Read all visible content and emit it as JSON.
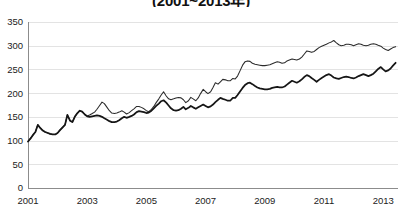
{
  "chart_data": {
    "type": "line",
    "title": "(2001~2013年)",
    "xlabel": "",
    "ylabel": "",
    "ylim": [
      0,
      350
    ],
    "xlim": [
      2001,
      2013.5
    ],
    "grid": true,
    "legend": "none",
    "ytick_labels": [
      "350",
      "300",
      "250",
      "200",
      "150",
      "100",
      "50",
      "0"
    ],
    "ytick_values": [
      350,
      300,
      250,
      200,
      150,
      100,
      50,
      0
    ],
    "xtick_labels": [
      "2001",
      "2003",
      "2005",
      "2007",
      "2009",
      "2011",
      "2013"
    ],
    "xtick_values": [
      2001,
      2003,
      2005,
      2007,
      2009,
      2011,
      2013
    ],
    "x": [
      2001.0,
      2001.08,
      2001.17,
      2001.25,
      2001.33,
      2001.42,
      2001.5,
      2001.58,
      2001.67,
      2001.75,
      2001.83,
      2001.92,
      2002.0,
      2002.08,
      2002.17,
      2002.25,
      2002.33,
      2002.42,
      2002.5,
      2002.58,
      2002.67,
      2002.75,
      2002.83,
      2002.92,
      2003.0,
      2003.08,
      2003.17,
      2003.25,
      2003.33,
      2003.42,
      2003.5,
      2003.58,
      2003.67,
      2003.75,
      2003.83,
      2003.92,
      2004.0,
      2004.08,
      2004.17,
      2004.25,
      2004.33,
      2004.42,
      2004.5,
      2004.58,
      2004.67,
      2004.75,
      2004.83,
      2004.92,
      2005.0,
      2005.08,
      2005.17,
      2005.25,
      2005.33,
      2005.42,
      2005.5,
      2005.58,
      2005.67,
      2005.75,
      2005.83,
      2005.92,
      2006.0,
      2006.08,
      2006.17,
      2006.25,
      2006.33,
      2006.42,
      2006.5,
      2006.58,
      2006.67,
      2006.75,
      2006.83,
      2006.92,
      2007.0,
      2007.08,
      2007.17,
      2007.25,
      2007.33,
      2007.42,
      2007.5,
      2007.58,
      2007.67,
      2007.75,
      2007.83,
      2007.92,
      2008.0,
      2008.08,
      2008.17,
      2008.25,
      2008.33,
      2008.42,
      2008.5,
      2008.58,
      2008.67,
      2008.75,
      2008.83,
      2008.92,
      2009.0,
      2009.08,
      2009.17,
      2009.25,
      2009.33,
      2009.42,
      2009.5,
      2009.58,
      2009.67,
      2009.75,
      2009.83,
      2009.92,
      2010.0,
      2010.08,
      2010.17,
      2010.25,
      2010.33,
      2010.42,
      2010.5,
      2010.58,
      2010.67,
      2010.75,
      2010.83,
      2010.92,
      2011.0,
      2011.08,
      2011.17,
      2011.25,
      2011.33,
      2011.42,
      2011.5,
      2011.58,
      2011.67,
      2011.75,
      2011.83,
      2011.92,
      2012.0,
      2012.08,
      2012.17,
      2012.25,
      2012.33,
      2012.42,
      2012.5,
      2012.58,
      2012.67,
      2012.75,
      2012.83,
      2012.92,
      2013.0,
      2013.08,
      2013.17,
      2013.25,
      2013.33,
      2013.42
    ],
    "series": [
      {
        "name": "upper-series",
        "values": [
          98,
          104,
          112,
          118,
          133,
          126,
          121,
          118,
          116,
          114,
          113,
          113,
          116,
          122,
          128,
          133,
          154,
          142,
          139,
          150,
          158,
          163,
          161,
          155,
          152,
          154,
          157,
          160,
          166,
          174,
          181,
          178,
          170,
          163,
          158,
          157,
          158,
          160,
          163,
          160,
          156,
          159,
          163,
          167,
          172,
          172,
          170,
          167,
          163,
          161,
          166,
          172,
          180,
          188,
          196,
          203,
          194,
          188,
          186,
          188,
          190,
          191,
          190,
          186,
          180,
          184,
          191,
          188,
          184,
          190,
          199,
          208,
          203,
          199,
          203,
          212,
          222,
          219,
          224,
          229,
          228,
          226,
          226,
          231,
          230,
          236,
          248,
          259,
          266,
          268,
          267,
          263,
          261,
          260,
          259,
          258,
          258,
          259,
          260,
          262,
          264,
          266,
          265,
          263,
          264,
          268,
          270,
          272,
          271,
          270,
          272,
          276,
          282,
          289,
          288,
          286,
          288,
          292,
          296,
          299,
          301,
          303,
          306,
          308,
          311,
          306,
          302,
          300,
          301,
          303,
          303,
          302,
          300,
          302,
          304,
          303,
          301,
          300,
          301,
          303,
          304,
          303,
          301,
          299,
          295,
          292,
          290,
          293,
          296,
          298
        ]
      },
      {
        "name": "lower-series",
        "values": [
          98,
          104,
          112,
          118,
          133,
          126,
          121,
          118,
          116,
          114,
          113,
          113,
          116,
          122,
          128,
          133,
          154,
          142,
          139,
          150,
          158,
          163,
          161,
          155,
          151,
          150,
          151,
          152,
          153,
          152,
          150,
          147,
          144,
          141,
          139,
          139,
          140,
          143,
          147,
          150,
          148,
          150,
          152,
          155,
          160,
          162,
          161,
          160,
          158,
          159,
          163,
          168,
          173,
          178,
          183,
          185,
          180,
          174,
          168,
          164,
          163,
          164,
          167,
          171,
          166,
          169,
          173,
          170,
          167,
          170,
          173,
          176,
          173,
          170,
          172,
          176,
          181,
          186,
          190,
          188,
          186,
          184,
          184,
          190,
          190,
          196,
          204,
          211,
          217,
          221,
          222,
          219,
          215,
          212,
          210,
          209,
          208,
          208,
          209,
          211,
          212,
          213,
          212,
          212,
          214,
          218,
          222,
          226,
          224,
          222,
          225,
          229,
          234,
          238,
          236,
          232,
          228,
          224,
          228,
          232,
          235,
          238,
          240,
          237,
          233,
          231,
          230,
          232,
          234,
          235,
          234,
          232,
          231,
          233,
          236,
          238,
          240,
          238,
          236,
          238,
          241,
          246,
          251,
          255,
          250,
          246,
          248,
          252,
          258,
          264
        ]
      }
    ]
  }
}
